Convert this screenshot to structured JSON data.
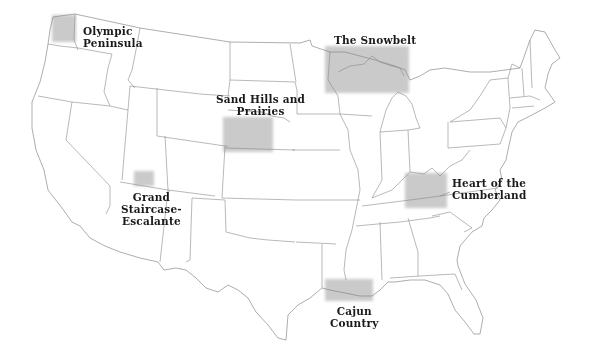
{
  "map": {
    "title": "United States regions map",
    "highlight_color": "#b8b8b8",
    "outline_color": "#8a8a8a",
    "regions": [
      {
        "id": "olympic",
        "label_lines": [
          "Olympic",
          "Peninsula"
        ]
      },
      {
        "id": "snowbelt",
        "label_lines": [
          "The Snowbelt"
        ]
      },
      {
        "id": "sandhills",
        "label_lines": [
          "Sand Hills and",
          "Prairies"
        ]
      },
      {
        "id": "grandstaircase",
        "label_lines": [
          "Grand",
          "Staircase-",
          "Escalante"
        ]
      },
      {
        "id": "cumberland",
        "label_lines": [
          "Heart of the",
          "Cumberland"
        ]
      },
      {
        "id": "cajun",
        "label_lines": [
          "Cajun",
          "Country"
        ]
      }
    ]
  }
}
